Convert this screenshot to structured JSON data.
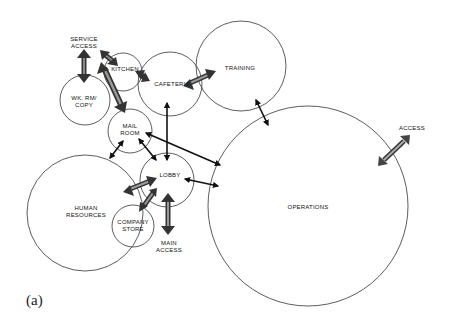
{
  "caption": "(a)",
  "rooms": [
    {
      "id": "kitchen",
      "label": [
        "KITCHEN"
      ]
    },
    {
      "id": "wk-rm-copy",
      "label": [
        "WK. RM/",
        "COPY"
      ]
    },
    {
      "id": "cafeteria",
      "label": [
        "CAFETERIA"
      ]
    },
    {
      "id": "training",
      "label": [
        "TRAINING"
      ]
    },
    {
      "id": "mail-room",
      "label": [
        "MAIL",
        "ROOM"
      ]
    },
    {
      "id": "lobby",
      "label": [
        "LOBBY"
      ]
    },
    {
      "id": "human-resources",
      "label": [
        "HUMAN",
        "RESOURCES"
      ]
    },
    {
      "id": "company-store",
      "label": [
        "COMPANY",
        "STORE"
      ]
    },
    {
      "id": "operations",
      "label": [
        "OPERATIONS"
      ]
    }
  ],
  "access_points": [
    {
      "id": "service-access",
      "label": [
        "SERVICE",
        "ACCESS"
      ]
    },
    {
      "id": "main-access",
      "label": [
        "MAIN",
        "ACCESS"
      ]
    },
    {
      "id": "operations-access",
      "label": [
        "ACCESS"
      ]
    }
  ],
  "connections": [
    {
      "from": "service-access",
      "to": "wk-rm-copy",
      "style": "heavy"
    },
    {
      "from": "service-access",
      "to": "kitchen",
      "style": "heavy"
    },
    {
      "from": "kitchen",
      "to": "cafeteria",
      "style": "heavy"
    },
    {
      "from": "wk-rm-copy",
      "to": "mail-room",
      "style": "heavy"
    },
    {
      "from": "cafeteria",
      "to": "training",
      "style": "heavy"
    },
    {
      "from": "cafeteria",
      "to": "lobby",
      "style": "light"
    },
    {
      "from": "training",
      "to": "operations",
      "style": "light"
    },
    {
      "from": "mail-room",
      "to": "human-resources",
      "style": "light"
    },
    {
      "from": "mail-room",
      "to": "lobby",
      "style": "light"
    },
    {
      "from": "mail-room",
      "to": "operations",
      "style": "light"
    },
    {
      "from": "lobby",
      "to": "operations",
      "style": "light"
    },
    {
      "from": "lobby",
      "to": "human-resources",
      "style": "heavy"
    },
    {
      "from": "lobby",
      "to": "company-store",
      "style": "heavy"
    },
    {
      "from": "lobby",
      "to": "main-access",
      "style": "heavy"
    },
    {
      "from": "operations",
      "to": "operations-access",
      "style": "heavy"
    }
  ]
}
